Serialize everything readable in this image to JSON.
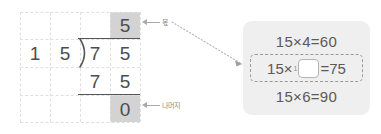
{
  "worksheet": {
    "name": "long-division-75-divided-by-15",
    "grid": {
      "cols": 4,
      "rows": 4,
      "line_style": "dashed",
      "line_color": "#e2e0dd"
    },
    "shaded_color": "#d3d3d3",
    "quotient_row": {
      "tens": "",
      "ones": "5"
    },
    "dividend_row": {
      "divisor_tens": "1",
      "divisor_ones": "5",
      "bracket": ")",
      "dividend_tens": "7",
      "dividend_ones": "5"
    },
    "subtract_row": {
      "tens": "7",
      "ones": "5"
    },
    "remainder_row": {
      "value": "0"
    },
    "labels": {
      "quotient": "몫",
      "remainder": "나머지"
    }
  },
  "hint_panel": {
    "name": "multiplication-hint-panel",
    "background": "#efefef",
    "rows": [
      {
        "id": "row-1",
        "text": "15×4=60",
        "highlighted": false
      },
      {
        "id": "row-2",
        "left": "15×",
        "superscript": "1",
        "blank_value": "",
        "right": "=75",
        "highlighted": true
      },
      {
        "id": "row-3",
        "text": "15×6=90",
        "highlighted": false
      }
    ]
  },
  "connector": {
    "name": "dotted-connector-line",
    "color": "#b8b8b8",
    "style": "dotted"
  }
}
